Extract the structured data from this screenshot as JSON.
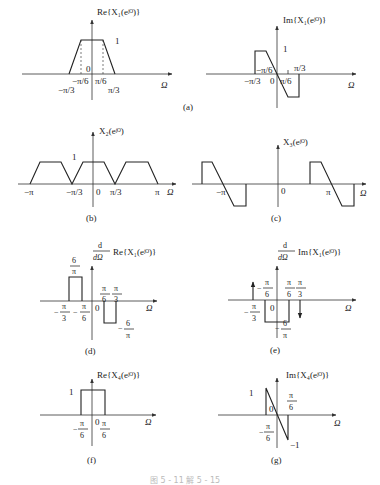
{
  "panels": {
    "a1": {
      "title": "Re{X₁(eʲᴼ)}",
      "peak": "1",
      "zero": "0",
      "ticks": [
        "−π/3",
        "−π/6",
        "π/6",
        "π/3"
      ],
      "axis": "Ω"
    },
    "a2": {
      "title": "Im{X₁(eʲᴼ)}",
      "peak": "1",
      "zero": "0",
      "ticks": [
        "−π/3",
        "−π/6",
        "π/6",
        "π/3"
      ],
      "axis": "Ω"
    },
    "a_caption": "(a)",
    "b": {
      "title": "X₂(eʲᴼ)",
      "peak": "1",
      "zero": "0",
      "ticks": [
        "−π",
        "−π/3",
        "π/3",
        "π"
      ],
      "axis": "Ω",
      "caption": "(b)"
    },
    "c": {
      "title": "X₃(eʲᴼ)",
      "zero": "0",
      "ticks": [
        "−π",
        "π"
      ],
      "axis": "Ω",
      "caption": "(c)"
    },
    "d": {
      "title_deriv_num": "d",
      "title_deriv_den": "dΩ",
      "title": "Re{X₁(eʲᴼ)}",
      "pos_num": "6",
      "pos_den": "π",
      "neg_prefix": "−",
      "neg_num": "6",
      "neg_den": "π",
      "zero": "0",
      "ticks": [
        {
          "sign": "−",
          "num": "π",
          "den": "3"
        },
        {
          "sign": "−",
          "num": "π",
          "den": "6"
        },
        {
          "sign": "",
          "num": "π",
          "den": "6"
        },
        {
          "sign": "",
          "num": "π",
          "den": "3"
        }
      ],
      "axis": "Ω",
      "caption": "(d)"
    },
    "e": {
      "title_deriv_num": "d",
      "title_deriv_den": "dΩ",
      "title": "Im{X₁(eʲᴼ)}",
      "neg_prefix": "−",
      "neg_num": "6",
      "neg_den": "π",
      "zero": "0",
      "ticks": [
        {
          "sign": "−",
          "num": "π",
          "den": "3"
        },
        {
          "sign": "−",
          "num": "π",
          "den": "6"
        },
        {
          "sign": "",
          "num": "π",
          "den": "6"
        },
        {
          "sign": "",
          "num": "π",
          "den": "3"
        }
      ],
      "axis": "Ω",
      "caption": "(e)"
    },
    "f": {
      "title": "Re{X₄(eʲᴼ)}",
      "peak": "1",
      "zero": "0",
      "ticks": [
        {
          "sign": "−",
          "num": "π",
          "den": "6"
        },
        {
          "sign": "",
          "num": "π",
          "den": "6"
        }
      ],
      "axis": "Ω",
      "caption": "(f)"
    },
    "g": {
      "title": "Im{X₄(eʲᴼ)}",
      "peak": "1",
      "trough": "−1",
      "zero": "0",
      "ticks": [
        {
          "sign": "−",
          "num": "π",
          "den": "6"
        },
        {
          "sign": "",
          "num": "π",
          "den": "6"
        }
      ],
      "axis": "Ω",
      "caption": "(g)"
    }
  },
  "figure_caption": "图 5 - 11   解 5 - 15"
}
